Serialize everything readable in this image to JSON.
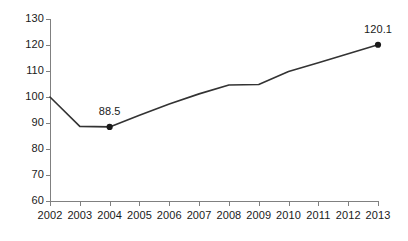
{
  "chart_data": {
    "type": "line",
    "title": "",
    "subtitle": "",
    "xlabel": "",
    "ylabel": "",
    "x": [
      2002,
      2003,
      2004,
      2005,
      2006,
      2007,
      2008,
      2009,
      2010,
      2011,
      2012,
      2013
    ],
    "categories": [
      "2002",
      "2003",
      "2004",
      "2005",
      "2006",
      "2007",
      "2008",
      "2009",
      "2010",
      "2011",
      "2012",
      "2013"
    ],
    "values": [
      100.0,
      88.7,
      88.5,
      93.0,
      97.3,
      101.2,
      104.6,
      104.8,
      109.8,
      113.2,
      116.6,
      120.1
    ],
    "series": [
      {
        "name": "index",
        "values": [
          100.0,
          88.7,
          88.5,
          93.0,
          97.3,
          101.2,
          104.6,
          104.8,
          109.8,
          113.2,
          116.6,
          120.1
        ]
      }
    ],
    "ylim": [
      60,
      130
    ],
    "xlim": [
      2002,
      2013
    ],
    "ytick_labels": [
      "130",
      "120",
      "110",
      "100",
      "90",
      "80",
      "70",
      "60"
    ],
    "ytick_values": [
      130,
      120,
      110,
      100,
      90,
      80,
      70,
      60
    ],
    "xtick_labels": [
      "2002",
      "2003",
      "2004",
      "2005",
      "2006",
      "2007",
      "2008",
      "2009",
      "2010",
      "2011",
      "2012",
      "2013"
    ],
    "grid": false,
    "legend": "none",
    "line_color": "#333333",
    "marker_color": "#1a1a1a",
    "axis_color": "#808080",
    "background_color": "#ffffff",
    "annotations": [
      {
        "label": "88.5",
        "x": 2004,
        "y": 88.5,
        "marker": true
      },
      {
        "label": "120.1",
        "x": 2013,
        "y": 120.1,
        "marker": true
      }
    ]
  },
  "axis": {
    "y_labels": [
      {
        "text": "130",
        "value": 130
      },
      {
        "text": "120",
        "value": 120
      },
      {
        "text": "110",
        "value": 110
      },
      {
        "text": "100",
        "value": 100
      },
      {
        "text": "90",
        "value": 90
      },
      {
        "text": "80",
        "value": 80
      },
      {
        "text": "70",
        "value": 70
      },
      {
        "text": "60",
        "value": 60
      }
    ],
    "x_labels": [
      {
        "text": "2002"
      },
      {
        "text": "2003"
      },
      {
        "text": "2004"
      },
      {
        "text": "2005"
      },
      {
        "text": "2006"
      },
      {
        "text": "2007"
      },
      {
        "text": "2008"
      },
      {
        "text": "2009"
      },
      {
        "text": "2010"
      },
      {
        "text": "2011"
      },
      {
        "text": "2012"
      },
      {
        "text": "2013"
      }
    ]
  },
  "labels": {
    "low_point": "88.5",
    "high_point": "120.1"
  }
}
